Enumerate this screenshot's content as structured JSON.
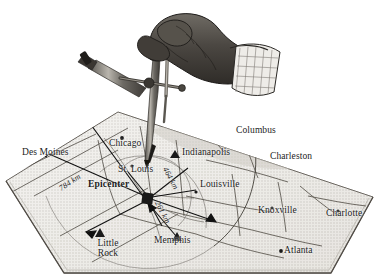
{
  "figure": {
    "style": "grayscale engraving / halftone illustration",
    "background_color": "#ffffff",
    "map_fill_color": "#e9e7e2",
    "line_color": "#3a3a3a",
    "ink_color": "#1c1c1c"
  },
  "instrument": {
    "name": "drafting-compass",
    "held_by": "hand",
    "description": "A hand holding a pair of dividers / drafting compass whose point rests on the map, scribing an arc"
  },
  "map": {
    "epicenter_label": "Epicenter",
    "cities": [
      {
        "name": "Des Moines",
        "marker": "triangle",
        "x": 22,
        "y": 154,
        "align": "left"
      },
      {
        "name": "Chicago",
        "marker": "dot",
        "x": 113,
        "y": 145,
        "align": "left"
      },
      {
        "name": "Indianapolis",
        "marker": "triangle",
        "x": 180,
        "y": 153,
        "align": "left"
      },
      {
        "name": "Columbus",
        "marker": "dot",
        "x": 240,
        "y": 133,
        "align": "left"
      },
      {
        "name": "Charleston",
        "marker": "dot",
        "x": 276,
        "y": 158,
        "align": "left"
      },
      {
        "name": "St. Louis",
        "marker": "dot",
        "x": 122,
        "y": 170,
        "align": "left"
      },
      {
        "name": "Louisville",
        "marker": "dot",
        "x": 202,
        "y": 184,
        "align": "left"
      },
      {
        "name": "Knoxville",
        "marker": "dot",
        "x": 263,
        "y": 212,
        "align": "left"
      },
      {
        "name": "Charlotte",
        "marker": "dot",
        "x": 331,
        "y": 215,
        "align": "left"
      },
      {
        "name": "Memphis",
        "marker": "triangle",
        "x": 159,
        "y": 240,
        "align": "left"
      },
      {
        "name": "Atlanta",
        "marker": "dot",
        "x": 286,
        "y": 248,
        "align": "left"
      },
      {
        "name": "Little Rock",
        "marker": "triangle",
        "x": 92,
        "y": 245,
        "align": "center"
      }
    ],
    "distance_arrows": [
      {
        "label": "784 km",
        "to": "Des Moines",
        "x": 70,
        "y": 193,
        "rotate": -34
      },
      {
        "label": "464 km",
        "to": "Louisville",
        "x": 180,
        "y": 178,
        "rotate": 62
      },
      {
        "label": "261 km",
        "to": "Memphis",
        "x": 172,
        "y": 210,
        "rotate": 62
      }
    ]
  }
}
